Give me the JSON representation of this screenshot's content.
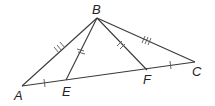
{
  "diagram": {
    "type": "triangle",
    "points": {
      "A": {
        "label": "A",
        "x": 22,
        "y": 86
      },
      "B": {
        "label": "B",
        "x": 97,
        "y": 18
      },
      "C": {
        "label": "C",
        "x": 195,
        "y": 62
      },
      "E": {
        "label": "E",
        "x": 66,
        "y": 80
      },
      "F": {
        "label": "F",
        "x": 147,
        "y": 70
      }
    },
    "segments": [
      "AB",
      "BC",
      "AC",
      "BE",
      "BF"
    ],
    "tick_marks": {
      "AB": 3,
      "BC": 3,
      "BE": 2,
      "BF": 2,
      "AE": 1,
      "FC": 1
    },
    "label_text": {
      "A": "A",
      "B": "B",
      "C": "C",
      "E": "E",
      "F": "F"
    }
  }
}
